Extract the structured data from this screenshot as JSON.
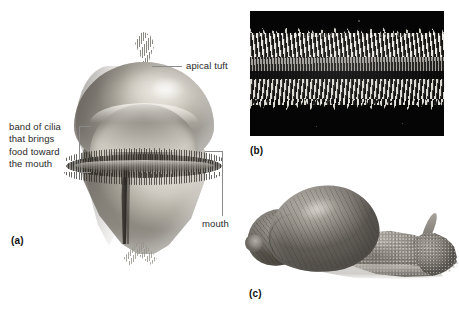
{
  "figure": {
    "panels": [
      {
        "tag": "(a)",
        "name": "veliger-larva-drawing",
        "description": "Drawing of a molluscan veliger larva"
      },
      {
        "tag": "(b)",
        "name": "radula-micrograph",
        "description": "Dark-field micrograph of a radula ribbon with rows of teeth"
      },
      {
        "tag": "(c)",
        "name": "snail-photograph",
        "description": "Photograph of a land snail with coiled shell, foot and tentacles"
      }
    ],
    "callouts": {
      "apical_tuft": "apical tuft",
      "band_of_cilia": "band of cilia\nthat brings\nfood toward\nthe mouth",
      "mouth": "mouth"
    },
    "tags": {
      "a": "(a)",
      "b": "(b)",
      "c": "(c)"
    }
  }
}
